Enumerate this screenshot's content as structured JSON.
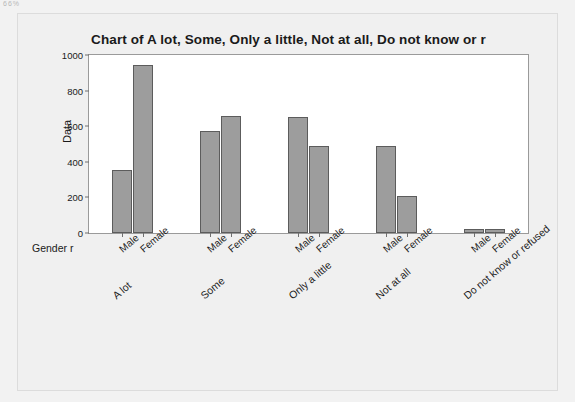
{
  "artifact_text": "66%",
  "chart_data": {
    "type": "bar",
    "title": "Chart of A lot, Some, Only a little, Not at all, Do not know or r",
    "xlabel": "Gender r",
    "ylabel": "Data",
    "ylim": [
      0,
      1000
    ],
    "yticks": [
      0,
      200,
      400,
      600,
      800,
      1000
    ],
    "ytick_labels": [
      "0",
      "200",
      "400",
      "600",
      "800",
      "1000"
    ],
    "grid": false,
    "legend": "none",
    "categories": [
      "A lot",
      "Some",
      "Only a little",
      "Not at all",
      "Do not know or refused"
    ],
    "subcategories": [
      "Male",
      "Female"
    ],
    "series": [
      {
        "name": "Male",
        "values": [
          355,
          575,
          650,
          490,
          20
        ]
      },
      {
        "name": "Female",
        "values": [
          945,
          660,
          490,
          210,
          25
        ]
      }
    ],
    "bar_color": "#9d9d9d",
    "bar_edge_color": "#5c5c5c",
    "plot_background": "#ffffff",
    "panel_background": "#f0f0f0"
  }
}
